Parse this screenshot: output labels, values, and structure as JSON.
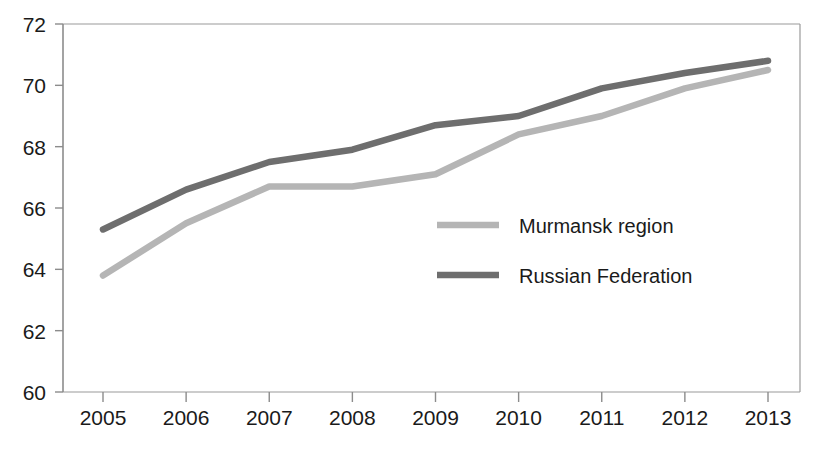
{
  "chart_data": {
    "type": "line",
    "title": "",
    "xlabel": "",
    "ylabel": "",
    "categories": [
      "2005",
      "2006",
      "2007",
      "2008",
      "2009",
      "2010",
      "2011",
      "2012",
      "2013"
    ],
    "x": [
      2005,
      2006,
      2007,
      2008,
      2009,
      2010,
      2011,
      2012,
      2013
    ],
    "ylim": [
      60,
      72
    ],
    "y_ticks": [
      "60",
      "62",
      "64",
      "66",
      "68",
      "70",
      "72"
    ],
    "y_tick_values": [
      60,
      62,
      64,
      66,
      68,
      70,
      72
    ],
    "grid": false,
    "legend_position": "center",
    "series": [
      {
        "name": "Murmansk region",
        "color": "#b5b5b5",
        "values": [
          63.8,
          65.5,
          66.7,
          66.7,
          67.1,
          68.4,
          69.0,
          69.9,
          70.5
        ]
      },
      {
        "name": "Russian Federation",
        "color": "#6e6e6e",
        "values": [
          65.3,
          66.6,
          67.5,
          67.9,
          68.7,
          69.0,
          69.9,
          70.4,
          70.8
        ]
      }
    ]
  },
  "axes": {
    "y_tick_labels": [
      "72",
      "70",
      "68",
      "66",
      "64",
      "62",
      "60"
    ],
    "x_tick_labels": [
      "2005",
      "2006",
      "2007",
      "2008",
      "2009",
      "2010",
      "2011",
      "2012",
      "2013"
    ]
  },
  "legend": {
    "items": [
      {
        "label": "Murmansk region",
        "color": "#b5b5b5"
      },
      {
        "label": "Russian Federation",
        "color": "#6e6e6e"
      }
    ]
  },
  "colors": {
    "axis": "#8c8c8c",
    "text": "#1a1a1a",
    "background": "#ffffff",
    "series_light": "#b5b5b5",
    "series_dark": "#6e6e6e"
  }
}
